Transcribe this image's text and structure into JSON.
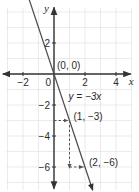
{
  "chart_data": {
    "type": "line",
    "title": "",
    "xlabel": "x",
    "ylabel": "y",
    "xlim": [
      -3,
      5
    ],
    "ylim": [
      -7.5,
      4.5
    ],
    "grid": true,
    "x_ticks": [
      -2,
      0,
      2,
      4
    ],
    "y_ticks": [
      2,
      -2,
      -4,
      -6
    ],
    "x_tick_labels": [
      "−2",
      "0",
      "2",
      "4"
    ],
    "y_tick_labels": [
      "2",
      "−2",
      "−4",
      "−6"
    ],
    "origin_label": "0",
    "series": [
      {
        "name": "y = −3x",
        "equation": "y = -3x",
        "slope": -3,
        "intercept": 0,
        "x": [
          -1.9,
          2.5
        ],
        "y": [
          5.7,
          -7.5
        ],
        "color": "#4a4a4a"
      }
    ],
    "points": [
      {
        "x": 0,
        "y": 0,
        "label": "(0, 0)"
      },
      {
        "x": 1,
        "y": -3,
        "label": "(1, −3)"
      },
      {
        "x": 2,
        "y": -6,
        "label": "(2, −6)"
      }
    ],
    "annotations": [
      {
        "type": "dashed-arrow",
        "from": [
          0,
          -3
        ],
        "to": [
          1,
          -3
        ]
      },
      {
        "type": "dashed-arrow",
        "from": [
          1,
          -3
        ],
        "to": [
          1,
          -6
        ]
      },
      {
        "type": "dashed-arrow",
        "from": [
          1,
          -6
        ],
        "to": [
          2,
          -6
        ]
      },
      {
        "type": "text",
        "at": [
          2.1,
          -2.0
        ],
        "text": "y = −3x"
      }
    ]
  },
  "colors": {
    "grid": "#e6e6e6",
    "axis": "#333333",
    "line": "#4a4a4a",
    "text": "#2b2b2b"
  }
}
